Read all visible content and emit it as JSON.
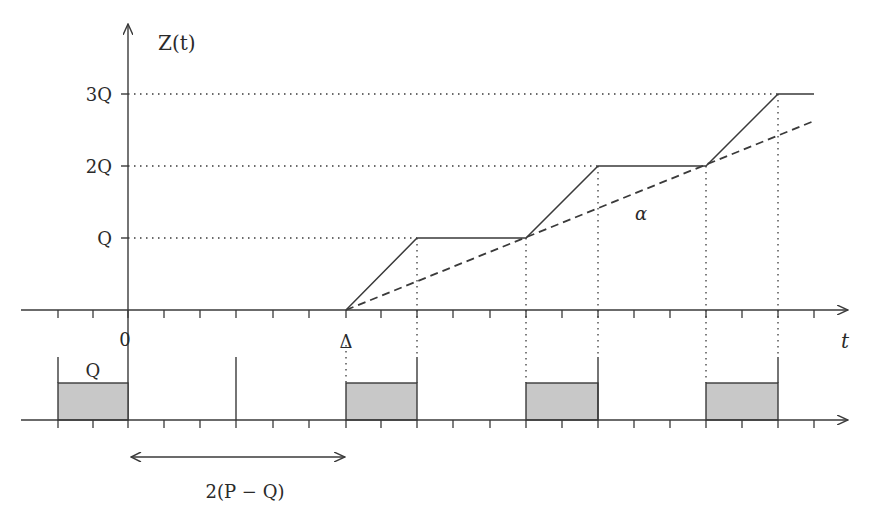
{
  "diagram": {
    "type": "timeline-step-diagram",
    "y_axis_label": "Z(t)",
    "x_axis_label": "t",
    "level_labels": [
      "Q",
      "2Q",
      "3Q"
    ],
    "origin_label": "0",
    "delta_label": "Δ",
    "slope_label": "α",
    "bar_label": "Q",
    "interval_label": "2(P − Q)",
    "colors": {
      "line": "#3a3a3a",
      "bar_fill": "#c8c8c8",
      "background": "#ffffff"
    },
    "geometry": {
      "x_axis_y": 310,
      "y_axis_x": 128,
      "tick_spacing": 36,
      "level_y": {
        "Q": 238,
        "2Q": 166,
        "3Q": 94
      },
      "z_curve_points": [
        [
          346,
          310
        ],
        [
          417,
          238
        ],
        [
          526,
          238
        ],
        [
          598,
          166
        ],
        [
          706,
          166
        ],
        [
          778,
          94
        ],
        [
          814,
          94
        ]
      ],
      "dashed_line": [
        [
          346,
          310
        ],
        [
          814,
          121
        ]
      ],
      "lower_axis_y": 420,
      "bars": [
        [
          58,
          128
        ],
        [
          346,
          417
        ],
        [
          526,
          598
        ],
        [
          706,
          778
        ]
      ],
      "bar_top_y": 383
    }
  }
}
